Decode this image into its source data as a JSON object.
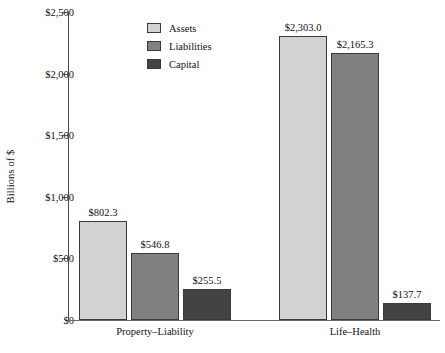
{
  "chart_data": {
    "type": "bar",
    "title": "",
    "xlabel": "",
    "ylabel": "Billions of $",
    "categories": [
      "Property–Liability",
      "Life–Health"
    ],
    "series": [
      {
        "name": "Assets",
        "color": "#d2d2d2",
        "values": [
          802.3,
          2303.0
        ],
        "labels": [
          "$802.3",
          "$2,303.0"
        ]
      },
      {
        "name": "Liabilities",
        "color": "#808080",
        "values": [
          546.8,
          2165.3
        ],
        "labels": [
          "$546.8",
          "$2,165.3"
        ]
      },
      {
        "name": "Capital",
        "color": "#434343",
        "values": [
          255.5,
          137.7
        ],
        "labels": [
          "$255.5",
          "$137.7"
        ]
      }
    ],
    "ylim": [
      0,
      2500
    ],
    "yticks": [
      0,
      500,
      1000,
      1500,
      2000,
      2500
    ],
    "ytick_labels": [
      "$0",
      "$500",
      "$1,000",
      "$1,500",
      "$2,000",
      "$2,500"
    ],
    "grid": false,
    "legend_position": "upper-left-inside",
    "value_labels_shown": true
  },
  "axis": {
    "y_label": "Billions of $"
  },
  "legend": {
    "items": [
      {
        "label": "Assets",
        "color": "#d2d2d2"
      },
      {
        "label": "Liabilities",
        "color": "#808080"
      },
      {
        "label": "Capital",
        "color": "#434343"
      }
    ]
  }
}
